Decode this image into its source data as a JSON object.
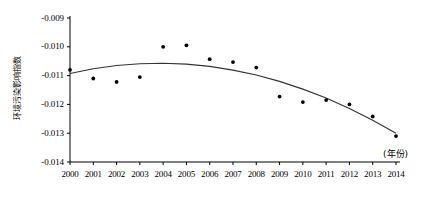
{
  "chart_data": {
    "type": "scatter",
    "title": "",
    "subtitle": "",
    "xlabel": "(年份)",
    "ylabel": "环境污染影响指数",
    "xlim": [
      2000,
      2014
    ],
    "ylim": [
      -0.014,
      -0.009
    ],
    "grid": false,
    "legend": "none",
    "x_tick_labels": [
      "2000",
      "2001",
      "2002",
      "2003",
      "2004",
      "2005",
      "2006",
      "2007",
      "2008",
      "2009",
      "2010",
      "2011",
      "2012",
      "2013",
      "2014"
    ],
    "y_tick_labels": [
      "-0.009",
      "-0.010",
      "-0.011",
      "-0.012",
      "-0.013",
      "-0.014"
    ],
    "y_tick_values": [
      -0.009,
      -0.01,
      -0.011,
      -0.012,
      -0.013,
      -0.014
    ],
    "categories": [
      2000,
      2001,
      2002,
      2003,
      2004,
      2005,
      2006,
      2007,
      2008,
      2009,
      2010,
      2011,
      2012,
      2013,
      2014
    ],
    "series": [
      {
        "name": "环境污染影响指数",
        "type": "scatter",
        "marker": "filled-circle",
        "color": "#000000",
        "values": [
          -0.0108,
          -0.0111,
          -0.01122,
          -0.01105,
          -0.01,
          -0.00995,
          -0.01043,
          -0.01053,
          -0.01072,
          -0.01173,
          -0.01192,
          -0.01185,
          -0.012,
          -0.01242,
          -0.0131
        ]
      },
      {
        "name": "拟合趋势线",
        "type": "line",
        "color": "#333333",
        "values": [
          -0.01093,
          -0.01076,
          -0.01065,
          -0.01059,
          -0.01057,
          -0.0106,
          -0.01068,
          -0.01081,
          -0.01098,
          -0.0112,
          -0.01147,
          -0.01178,
          -0.01214,
          -0.01255,
          -0.013
        ]
      }
    ],
    "annotations": []
  },
  "axis": {
    "x_unit_note": "(年份)",
    "y_axis_caption": "环境污染影响指数"
  }
}
